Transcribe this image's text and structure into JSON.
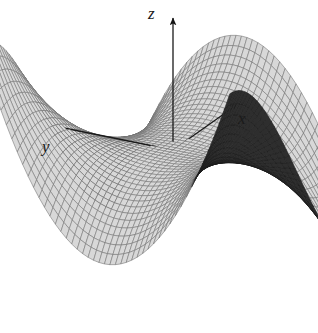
{
  "figure": {
    "title": "",
    "background_color": "#ffffff",
    "width": 318,
    "height": 333
  },
  "axes": {
    "z": {
      "label": "z",
      "origin": [
        173,
        150
      ],
      "tip": [
        173,
        18
      ],
      "arrow": "arrow-up"
    },
    "x": {
      "label": "x",
      "origin": [
        173,
        150
      ],
      "tip": [
        238,
        104
      ],
      "arrow": "arrow-up-right"
    },
    "y": {
      "label": "y",
      "origin": [
        173,
        150
      ],
      "tip": [
        54,
        126
      ],
      "arrow": "arrow-left"
    },
    "line_color": "#1a1a1a"
  },
  "chart_data": {
    "type": "surface",
    "title": "",
    "xlabel": "x",
    "ylabel": "y",
    "zlabel": "z",
    "surface_name": "monkey-saddle",
    "equation": "z = x^3 - 3xy^2",
    "grid": true,
    "legend": "none",
    "xlim": [
      -1.35,
      1.35
    ],
    "ylim": [
      -1.35,
      1.35
    ],
    "zlim": [
      -4.5,
      4.5
    ],
    "mesh": {
      "u_divisions": 46,
      "v_divisions": 46,
      "line_color_top": "#707070",
      "line_color_bottom": "#1c1c1c",
      "fill_color_top": "#d8d8d8",
      "fill_color_bottom": "#2e2e2e"
    },
    "projection": {
      "type": "axonometric",
      "origin_px": [
        173,
        150
      ],
      "x_axis_px": [
        0.47,
        -0.335
      ],
      "y_axis_px": [
        -0.86,
        -0.172
      ],
      "z_axis_px": [
        0,
        -0.245
      ],
      "scale": 108
    },
    "features": [
      {
        "name": "peak-back-left",
        "px": [
          133,
          50
        ]
      },
      {
        "name": "tip-upper-right",
        "px": [
          310,
          48
        ]
      },
      {
        "name": "tip-lower-left",
        "px": [
          30,
          232
        ]
      },
      {
        "name": "tip-bottom",
        "px": [
          216,
          318
        ]
      },
      {
        "name": "saddle-origin",
        "px": [
          173,
          150
        ]
      }
    ]
  }
}
